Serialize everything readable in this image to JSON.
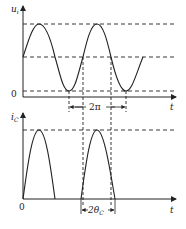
{
  "top_plot": {
    "y_label": "u",
    "y_label_sub": "i",
    "x_label": "t",
    "origin_label": "0",
    "period_label": "2π",
    "curve": "sinusoid with DC offset",
    "levels": [
      "max",
      "bias",
      "min"
    ]
  },
  "bottom_plot": {
    "y_label": "i",
    "y_label_sub": "C",
    "x_label": "t",
    "origin_label": "0",
    "conduction_label": "2θ",
    "conduction_label_sub": "C",
    "curve": "periodic half-cosine current pulses"
  },
  "colors": {
    "line": "#222222",
    "background": "#ffffff"
  }
}
